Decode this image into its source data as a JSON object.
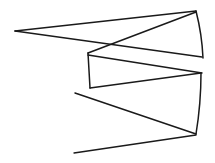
{
  "figure": {
    "background_color": "#ffffff",
    "stroke_color": "#1a1a1a",
    "stroke_width": 1.5,
    "width": 215,
    "height": 163
  },
  "chart_data": {
    "type": "line",
    "title": "",
    "xlabel": "",
    "ylabel": "",
    "grid": false,
    "legend": null,
    "xlim": [
      0,
      215
    ],
    "ylim": [
      0,
      163
    ],
    "series": [
      {
        "name": "upper-wedge-top",
        "points": [
          [
            15,
            31
          ],
          [
            196,
            11
          ]
        ]
      },
      {
        "name": "upper-wedge-bottom",
        "points": [
          [
            15,
            31
          ],
          [
            202,
            57
          ]
        ]
      },
      {
        "name": "right-edge-upper",
        "points": [
          [
            196,
            11
          ],
          [
            203,
            58
          ]
        ]
      },
      {
        "name": "upper-diagonal-descend",
        "points": [
          [
            196,
            12
          ],
          [
            88,
            53
          ]
        ]
      },
      {
        "name": "mid-left-vertical",
        "points": [
          [
            88,
            53
          ],
          [
            90,
            88
          ]
        ]
      },
      {
        "name": "mid-upper-diagonal",
        "points": [
          [
            88,
            55
          ],
          [
            202,
            73
          ]
        ]
      },
      {
        "name": "mid-lower-diagonal",
        "points": [
          [
            90,
            88
          ],
          [
            201,
            73
          ]
        ]
      },
      {
        "name": "right-edge-lower",
        "points": [
          [
            201,
            73
          ],
          [
            196,
            134
          ]
        ]
      },
      {
        "name": "lower-diagonal-to-left",
        "points": [
          [
            196,
            134
          ],
          [
            75,
            93
          ]
        ]
      },
      {
        "name": "bottom-tail",
        "points": [
          [
            196,
            135
          ],
          [
            74,
            153
          ]
        ]
      }
    ]
  },
  "polylines": [
    {
      "name": "primary-zigzag",
      "points": "15,31 196,11 203,58 202,57 15,31"
    },
    {
      "name": "secondary-zigzag",
      "points": "196,12 88,53 90,88 201,73 196,134 75,93"
    }
  ]
}
